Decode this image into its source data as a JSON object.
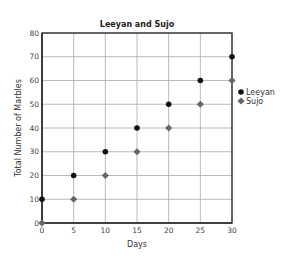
{
  "chart_data": {
    "type": "scatter",
    "title": "Leeyan and Sujo",
    "xlabel": "Days",
    "ylabel": "Total Number of Marbles",
    "x": [
      0,
      5,
      10,
      15,
      20,
      25,
      30
    ],
    "x_ticks": [
      0,
      5,
      10,
      15,
      20,
      25,
      30
    ],
    "y_ticks": [
      0,
      10,
      20,
      30,
      40,
      50,
      60,
      70,
      80
    ],
    "xlim": [
      0,
      30
    ],
    "ylim": [
      0,
      80
    ],
    "grid": true,
    "legend_position": "right",
    "series": [
      {
        "name": "Leeyan",
        "marker": "circle",
        "color": "#111111",
        "values": [
          10,
          20,
          30,
          40,
          50,
          60,
          70
        ]
      },
      {
        "name": "Sujo",
        "marker": "diamond",
        "color": "#666666",
        "values": [
          0,
          10,
          20,
          30,
          40,
          50,
          60
        ]
      }
    ]
  }
}
